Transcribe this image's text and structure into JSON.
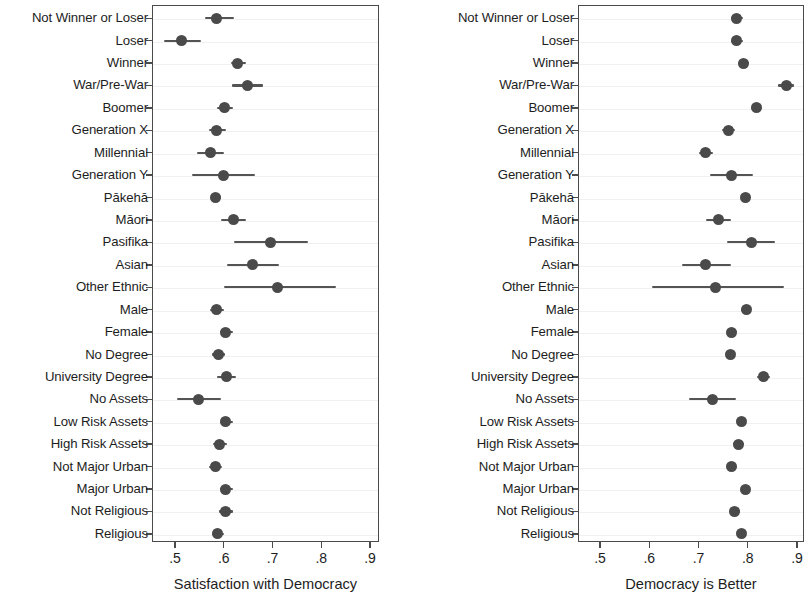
{
  "chart_data": [
    {
      "type": "scatter",
      "panel": "left",
      "title": "",
      "xlabel": "Satisfaction with Democracy",
      "ylabel": "",
      "xlim": [
        0.455,
        0.875
      ],
      "xticks": [
        0.5,
        0.6,
        0.7,
        0.8,
        0.9
      ],
      "xticklabels": [
        ".5",
        ".6",
        ".7",
        ".8",
        ".9"
      ],
      "grid": true,
      "legend": "none",
      "marker": "filled-circle",
      "error_bars": "horizontal confidence intervals",
      "categories": [
        "Not Winner or Loser",
        "Loser",
        "Winner",
        "War/Pre-War",
        "Boomer",
        "Generation X",
        "Millennial",
        "Generation Y",
        "Pākehā",
        "Māori",
        "Pasifika",
        "Asian",
        "Other Ethnic",
        "Male",
        "Female",
        "No Degree",
        "University Degree",
        "No Assets",
        "Low Risk Assets",
        "High Risk Assets",
        "Not Major Urban",
        "Major Urban",
        "Not Religious",
        "Religious"
      ],
      "values": [
        0.586,
        0.514,
        0.629,
        0.648,
        0.601,
        0.586,
        0.572,
        0.599,
        0.584,
        0.619,
        0.695,
        0.658,
        0.711,
        0.586,
        0.604,
        0.589,
        0.605,
        0.548,
        0.604,
        0.591,
        0.583,
        0.604,
        0.603,
        0.588
      ],
      "ci_low": [
        0.562,
        0.478,
        0.614,
        0.616,
        0.586,
        0.57,
        0.545,
        0.535,
        0.575,
        0.595,
        0.62,
        0.606,
        0.6,
        0.572,
        0.592,
        0.576,
        0.586,
        0.505,
        0.592,
        0.578,
        0.57,
        0.592,
        0.591,
        0.576
      ],
      "ci_high": [
        0.621,
        0.553,
        0.646,
        0.68,
        0.618,
        0.604,
        0.6,
        0.665,
        0.595,
        0.645,
        0.773,
        0.714,
        0.83,
        0.601,
        0.618,
        0.603,
        0.626,
        0.595,
        0.618,
        0.606,
        0.597,
        0.618,
        0.618,
        0.601
      ]
    },
    {
      "type": "scatter",
      "panel": "right",
      "title": "",
      "xlabel": "Democracy is Better",
      "ylabel": "",
      "xlim": [
        0.455,
        0.915
      ],
      "xticks": [
        0.5,
        0.6,
        0.7,
        0.8,
        0.9
      ],
      "xticklabels": [
        ".5",
        ".6",
        ".7",
        ".8",
        ".9"
      ],
      "grid": true,
      "legend": "none",
      "marker": "filled-circle",
      "error_bars": "horizontal confidence intervals",
      "categories": [
        "Not Winner or Loser",
        "Loser",
        "Winner",
        "War/Pre-War",
        "Boomer",
        "Generation X",
        "Millennial",
        "Generation Y",
        "Pākehā",
        "Māori",
        "Pasifika",
        "Asian",
        "Other Ethnic",
        "Male",
        "Female",
        "No Degree",
        "University Degree",
        "No Assets",
        "Low Risk Assets",
        "High Risk Assets",
        "Not Major Urban",
        "Major Urban",
        "Not Religious",
        "Religious"
      ],
      "values": [
        0.778,
        0.778,
        0.792,
        0.878,
        0.817,
        0.76,
        0.715,
        0.766,
        0.795,
        0.74,
        0.807,
        0.715,
        0.734,
        0.797,
        0.768,
        0.764,
        0.831,
        0.728,
        0.787,
        0.781,
        0.768,
        0.795,
        0.774,
        0.787
      ],
      "ci_low": [
        0.766,
        0.765,
        0.782,
        0.862,
        0.806,
        0.747,
        0.7,
        0.723,
        0.787,
        0.715,
        0.757,
        0.666,
        0.605,
        0.787,
        0.758,
        0.755,
        0.818,
        0.68,
        0.778,
        0.77,
        0.759,
        0.786,
        0.764,
        0.778
      ],
      "ci_high": [
        0.791,
        0.791,
        0.802,
        0.893,
        0.829,
        0.774,
        0.73,
        0.81,
        0.804,
        0.766,
        0.855,
        0.765,
        0.873,
        0.807,
        0.779,
        0.774,
        0.845,
        0.777,
        0.797,
        0.792,
        0.778,
        0.805,
        0.785,
        0.797
      ]
    }
  ],
  "style": {
    "marker_color": "#4a4a4a",
    "whisker_color": "#545454",
    "axis_color": "#4b4b4b",
    "grid_color": "#f0f0f0",
    "background": "#ffffff"
  }
}
